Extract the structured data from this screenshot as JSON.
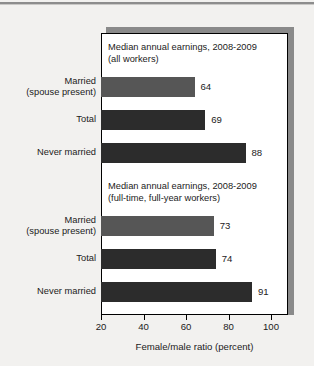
{
  "chart_data": {
    "type": "bar",
    "orientation": "horizontal",
    "title": "",
    "xlabel": "Female/male ratio (percent)",
    "ylabel": "",
    "xlim": [
      20,
      108
    ],
    "xticks": [
      20,
      40,
      60,
      80,
      100
    ],
    "xtick_labels": [
      "20",
      "40",
      "60",
      "80",
      "100"
    ],
    "grid": false,
    "legend": false,
    "bar_baseline": 20,
    "groups": [
      {
        "caption_line1": "Median annual earnings, 2008-2009",
        "caption_line2": "(all workers)",
        "categories": [
          {
            "line1": "Married",
            "line2": "(spouse present)"
          },
          {
            "line1": "Total",
            "line2": ""
          },
          {
            "line1": "Never married",
            "line2": ""
          }
        ],
        "values": [
          64,
          69,
          88
        ],
        "value_labels": [
          "64",
          "69",
          "88"
        ],
        "bar_colors": [
          "#565656",
          "#2c2c2c",
          "#2c2c2c"
        ]
      },
      {
        "caption_line1": "Median annual earnings, 2008-2009",
        "caption_line2": "(full-time, full-year workers)",
        "categories": [
          {
            "line1": "Married",
            "line2": "(spouse present)"
          },
          {
            "line1": "Total",
            "line2": ""
          },
          {
            "line1": "Never married",
            "line2": ""
          }
        ],
        "values": [
          73,
          74,
          91
        ],
        "value_labels": [
          "73",
          "74",
          "91"
        ],
        "bar_colors": [
          "#565656",
          "#2c2c2c",
          "#2c2c2c"
        ]
      }
    ]
  },
  "colors": {
    "page_background": "#f2f1ef",
    "panel_background": "#ffffff",
    "panel_border": "#000000",
    "panel_shadow": "#8a8a8a",
    "bar_light": "#565656",
    "bar_dark": "#2c2c2c",
    "text": "#1b1b1b",
    "rule": "#8d8d8d"
  }
}
